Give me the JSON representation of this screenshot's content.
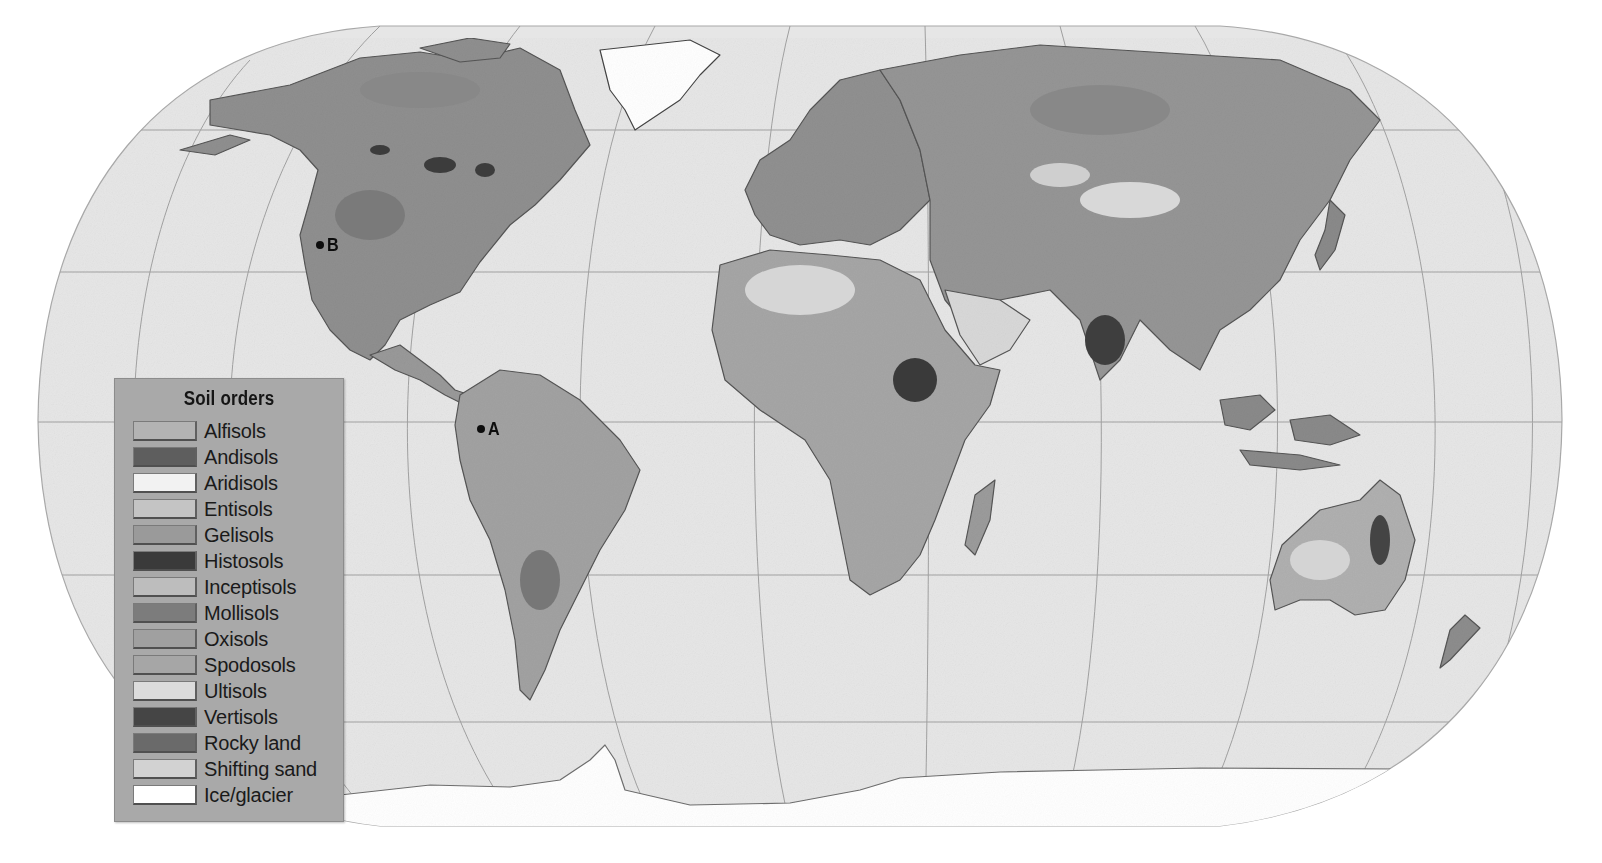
{
  "map": {
    "projection": "Robinson",
    "ocean_color": "#e6e6e6",
    "graticule_color": "#9a9a9a",
    "land_base_color": "#8e8e8e",
    "markers": [
      {
        "id": "A",
        "label": "A",
        "location": "Western Amazon basin, South America",
        "x": 481,
        "y": 428
      },
      {
        "id": "B",
        "label": "B",
        "location": "Nevada / Great Basin, western United States",
        "x": 320,
        "y": 245
      }
    ]
  },
  "legend": {
    "title": "Soil orders",
    "items": [
      {
        "label": "Alfisols",
        "color": "#b3b3b3"
      },
      {
        "label": "Andisols",
        "color": "#5e5e5e"
      },
      {
        "label": "Aridisols",
        "color": "#f2f2f2"
      },
      {
        "label": "Entisols",
        "color": "#c4c4c4"
      },
      {
        "label": "Gelisols",
        "color": "#9a9a9a"
      },
      {
        "label": "Histosols",
        "color": "#3a3a3a"
      },
      {
        "label": "Inceptisols",
        "color": "#bdbdbd"
      },
      {
        "label": "Mollisols",
        "color": "#7c7c7c"
      },
      {
        "label": "Oxisols",
        "color": "#a0a0a0"
      },
      {
        "label": "Spodosols",
        "color": "#a6a6a6"
      },
      {
        "label": "Ultisols",
        "color": "#dcdcdc"
      },
      {
        "label": "Vertisols",
        "color": "#454545"
      },
      {
        "label": "Rocky land",
        "color": "#6a6a6a"
      },
      {
        "label": "Shifting sand",
        "color": "#d2d2d2"
      },
      {
        "label": "Ice/glacier",
        "color": "#ffffff"
      }
    ]
  }
}
